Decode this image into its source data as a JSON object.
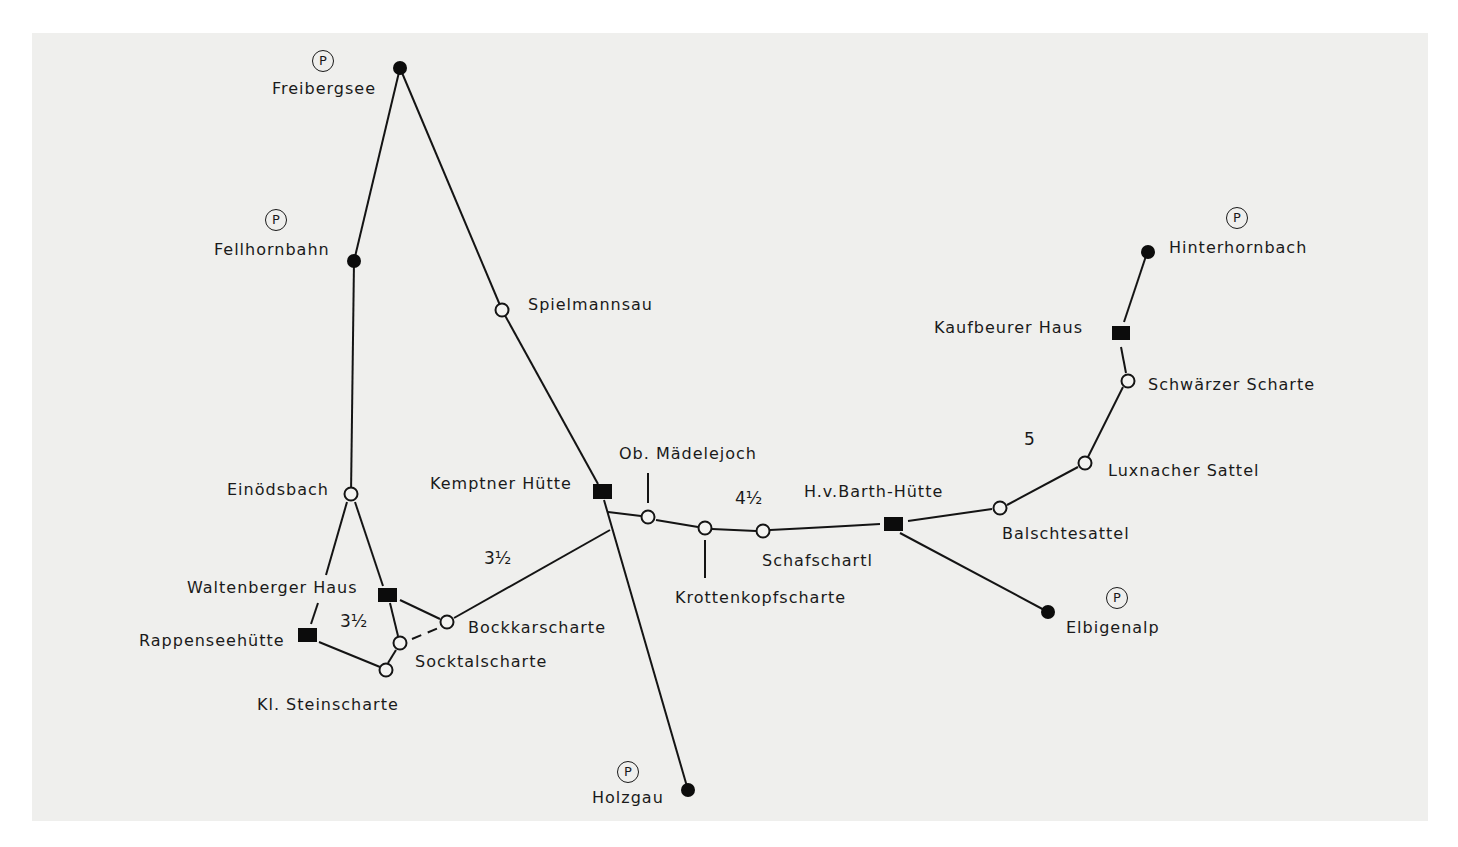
{
  "diagram": {
    "type": "hiking-route-network",
    "background_color": "#efefed",
    "line_color": "#141414",
    "legend_symbols": {
      "endpoint": "filled-circle",
      "pass": "open-circle",
      "hut": "filled-square",
      "parking": "circled-P"
    },
    "parking_symbol": "P",
    "nodes": [
      {
        "id": "freibergsee",
        "label": "Freibergsee",
        "type": "endpoint",
        "parking": true
      },
      {
        "id": "fellhornbahn",
        "label": "Fellhornbahn",
        "type": "endpoint",
        "parking": true
      },
      {
        "id": "spielmannsau",
        "label": "Spielmannsau",
        "type": "pass"
      },
      {
        "id": "einoedsbach",
        "label": "Einödsbach",
        "type": "pass"
      },
      {
        "id": "waltenberger",
        "label": "Waltenberger Haus",
        "type": "hut"
      },
      {
        "id": "rappensee",
        "label": "Rappenseehütte",
        "type": "hut"
      },
      {
        "id": "kl_steinscharte",
        "label": "Kl. Steinscharte",
        "type": "pass"
      },
      {
        "id": "socktalscharte",
        "label": "Socktalscharte",
        "type": "pass"
      },
      {
        "id": "bockkarscharte",
        "label": "Bockkarscharte",
        "type": "pass"
      },
      {
        "id": "kemptner",
        "label": "Kemptner Hütte",
        "type": "hut"
      },
      {
        "id": "holzgau",
        "label": "Holzgau",
        "type": "endpoint",
        "parking": true
      },
      {
        "id": "maedelejoch",
        "label": "Ob. Mädelejoch",
        "type": "pass"
      },
      {
        "id": "krottenkopf",
        "label": "Krottenkopfscharte",
        "type": "pass"
      },
      {
        "id": "schafschartl",
        "label": "Schafschartl",
        "type": "pass"
      },
      {
        "id": "hvbarth",
        "label": "H.v.Barth-Hütte",
        "type": "hut"
      },
      {
        "id": "elbigenalp",
        "label": "Elbigenalp",
        "type": "endpoint",
        "parking": true
      },
      {
        "id": "balschtesattel",
        "label": "Balschtesattel",
        "type": "pass"
      },
      {
        "id": "luxnacher",
        "label": "Luxnacher Sattel",
        "type": "pass"
      },
      {
        "id": "schwaerzer",
        "label": "Schwärzer Scharte",
        "type": "pass"
      },
      {
        "id": "kaufbeurer",
        "label": "Kaufbeurer Haus",
        "type": "hut"
      },
      {
        "id": "hinterhornbach",
        "label": "Hinterhornbach",
        "type": "endpoint",
        "parking": true
      }
    ],
    "edges": [
      [
        "freibergsee",
        "fellhornbahn"
      ],
      [
        "freibergsee",
        "spielmannsau"
      ],
      [
        "spielmannsau",
        "kemptner"
      ],
      [
        "fellhornbahn",
        "einoedsbach"
      ],
      [
        "einoedsbach",
        "rappensee"
      ],
      [
        "einoedsbach",
        "waltenberger"
      ],
      [
        "waltenberger",
        "socktalscharte"
      ],
      [
        "waltenberger",
        "bockkarscharte"
      ],
      [
        "rappensee",
        "kl_steinscharte"
      ],
      [
        "kl_steinscharte",
        "socktalscharte"
      ],
      [
        "socktalscharte",
        "bockkarscharte",
        "dashed"
      ],
      [
        "bockkarscharte",
        "kemptner"
      ],
      [
        "kemptner",
        "holzgau"
      ],
      [
        "kemptner",
        "maedelejoch"
      ],
      [
        "maedelejoch",
        "krottenkopf"
      ],
      [
        "krottenkopf",
        "schafschartl"
      ],
      [
        "schafschartl",
        "hvbarth"
      ],
      [
        "hvbarth",
        "elbigenalp"
      ],
      [
        "hvbarth",
        "balschtesattel"
      ],
      [
        "balschtesattel",
        "luxnacher"
      ],
      [
        "luxnacher",
        "schwaerzer"
      ],
      [
        "schwaerzer",
        "kaufbeurer"
      ],
      [
        "kaufbeurer",
        "hinterhornbach"
      ]
    ],
    "distances": {
      "waltenberger_area": "3½",
      "bockkar_kemptner": "3½",
      "kemptner_hvbarth": "4½",
      "hvbarth_kaufbeurer": "5"
    }
  },
  "labels": {
    "freibergsee": "Freibergsee",
    "fellhornbahn": "Fellhornbahn",
    "spielmannsau": "Spielmannsau",
    "einoedsbach": "Einödsbach",
    "waltenberger": "Waltenberger Haus",
    "rappensee": "Rappenseehütte",
    "kl_steinscharte": "Kl. Steinscharte",
    "socktalscharte": "Socktalscharte",
    "bockkarscharte": "Bockkarscharte",
    "kemptner": "Kemptner Hütte",
    "holzgau": "Holzgau",
    "maedelejoch": "Ob. Mädelejoch",
    "krottenkopf": "Krottenkopfscharte",
    "schafschartl": "Schafschartl",
    "hvbarth": "H.v.Barth-Hütte",
    "elbigenalp": "Elbigenalp",
    "balschtesattel": "Balschtesattel",
    "luxnacher": "Luxnacher Sattel",
    "schwaerzer": "Schwärzer Scharte",
    "kaufbeurer": "Kaufbeurer Haus",
    "hinterhornbach": "Hinterhornbach",
    "parking": "P",
    "dist_waltenberger": "3½",
    "dist_bockkar": "3½",
    "dist_kemptner_barth": "4½",
    "dist_barth_kaufbeurer": "5"
  }
}
